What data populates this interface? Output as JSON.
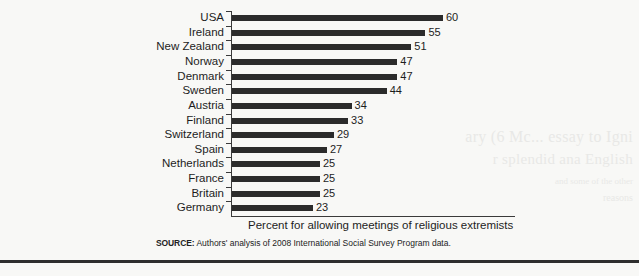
{
  "chart_data": {
    "type": "bar",
    "orientation": "horizontal",
    "title": "",
    "xlabel": "Percent for allowing meetings of religious extremists",
    "ylabel": "",
    "xlim": [
      0,
      60
    ],
    "grid": false,
    "legend": null,
    "categories": [
      "USA",
      "Ireland",
      "New Zealand",
      "Norway",
      "Denmark",
      "Sweden",
      "Austria",
      "Finland",
      "Switzerland",
      "Spain",
      "Netherlands",
      "France",
      "Britain",
      "Germany"
    ],
    "values": [
      60,
      55,
      51,
      47,
      47,
      44,
      34,
      33,
      29,
      27,
      25,
      25,
      25,
      23
    ],
    "value_labels": [
      "60",
      "55",
      "51",
      "47",
      "47",
      "44",
      "34",
      "33",
      "29",
      "27",
      "25",
      "25",
      "25",
      "23"
    ],
    "bar_color": "#2b2b2b",
    "axis_color": "#3a3a3a",
    "background_color": "#f8f8f6"
  },
  "source": {
    "label": "SOURCE:",
    "text": "Authors' analysis of 2008 International Social Survey Program data."
  },
  "showthrough": {
    "line1": "аry (6 Mc...  essay to Igni",
    "line2": "r splendid ana English",
    "line3": "and some of the other",
    "line4": "reasons"
  }
}
